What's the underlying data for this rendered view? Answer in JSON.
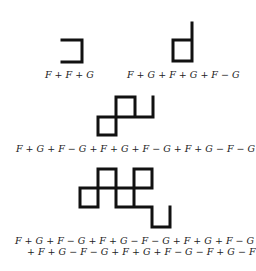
{
  "figure": {
    "stroke_color": "#111111",
    "stroke_width": 3,
    "panels": [
      {
        "id": "step-1",
        "formula_lines": [
          "F + F + G"
        ],
        "path": "M62,40 L82,40 L82,62 L62,62"
      },
      {
        "id": "step-2",
        "formula_lines": [
          "F + G + F + G + F − G"
        ],
        "path": "M192,23 L192,61 L173,61 L173,40 L192,40"
      },
      {
        "id": "step-3",
        "formula_lines": [
          "F + G + F − G + F + G + F − G + F + G − F − G"
        ],
        "path": "M153,97 L153,117 L135,117 L135,97 L116,97 L116,135 L98,135 L98,117 L135,117"
      },
      {
        "id": "step-4",
        "formula_lines": [
          "F + G + F − G + F + G − F − G + F + G + F − G",
          "+ F + G − F − G + F + G + F − G − F + G − F − G"
        ],
        "path": "M80,188 L80,207 L98,207 L98,169 L116,169 L116,207 L134,207 L134,169 L152,169 L152,188 L80,188 M116,188 L116,207 M134,207 L152,207 L152,227 L170,227 L170,207"
      }
    ]
  }
}
